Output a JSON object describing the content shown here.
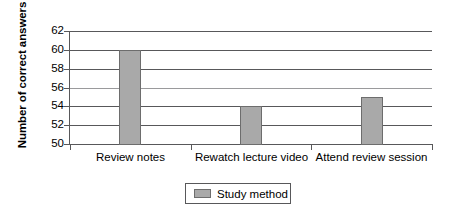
{
  "chart_data": {
    "type": "bar",
    "title": "",
    "subtitle": "",
    "xlabel": "",
    "ylabel": "Number of correct answers",
    "categories": [
      "Review notes",
      "Rewatch lecture video",
      "Attend review session"
    ],
    "values": [
      60,
      54,
      55
    ],
    "series": [
      {
        "name": "Study method",
        "values": [
          60,
          54,
          55
        ]
      }
    ],
    "ylim": [
      50,
      62
    ],
    "ytick_labels": [
      "62",
      "60",
      "58",
      "56",
      "54",
      "52",
      "50"
    ],
    "ytick_values": [
      62,
      60,
      58,
      56,
      54,
      52,
      50
    ],
    "ytick_step": 2,
    "grid": true,
    "grid_axis": "y",
    "legend": {
      "position": "bottom",
      "entries": [
        {
          "label": "Study method",
          "color": "#a9a9a9"
        }
      ]
    },
    "colors": {
      "bar_fill": "#a9a9a9",
      "bar_stroke": "#6d6d6d",
      "grid": "#58585a",
      "axis": "#58585a",
      "text": "#000000",
      "background": "#ffffff"
    }
  }
}
